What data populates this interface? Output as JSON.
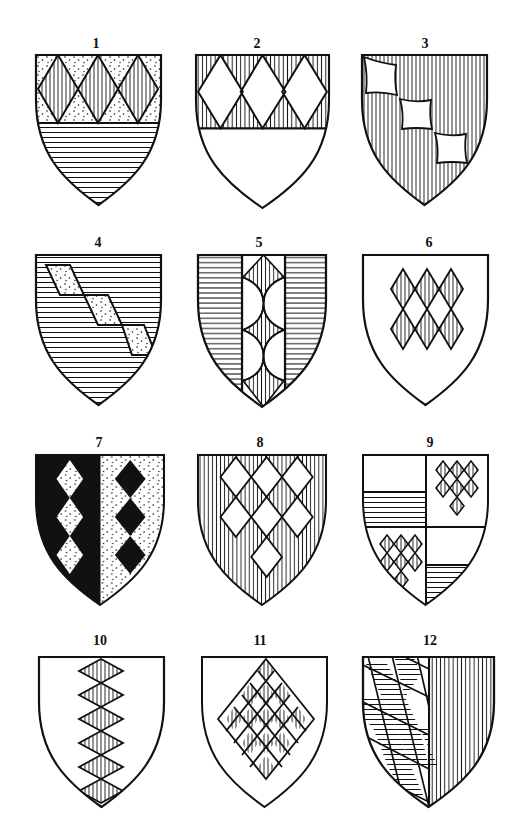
{
  "figure": {
    "ink_color": "#111111",
    "paper_color": "#ffffff",
    "shields": [
      {
        "number": "1",
        "x": 36,
        "y": 55,
        "w": 125,
        "h": 148,
        "description": "Chief dotted with three vertically hatched lozenges conjoined; base horizontally hatched"
      },
      {
        "number": "2",
        "x": 196,
        "y": 55,
        "w": 133,
        "h": 153,
        "description": "Chief vertically hatched with three plain lozenges conjoined; base plain"
      },
      {
        "number": "3",
        "x": 362,
        "y": 55,
        "w": 125,
        "h": 150,
        "description": "Vertically hatched field with three plain cushions in bend"
      },
      {
        "number": "4",
        "x": 36,
        "y": 255,
        "w": 125,
        "h": 150,
        "description": "Horizontally hatched field with three dotted fusils in bend"
      },
      {
        "number": "5",
        "x": 198,
        "y": 255,
        "w": 128,
        "h": 152,
        "description": "Horizontally hatched field, plain pale charged with vertically hatched mascles"
      },
      {
        "number": "6",
        "x": 363,
        "y": 255,
        "w": 126,
        "h": 150,
        "description": "Plain field with six vertically hatched lozenges, 3 and 3"
      },
      {
        "number": "7",
        "x": 36,
        "y": 455,
        "w": 128,
        "h": 150,
        "description": "Party per pale black and dotted, three lozenges counterchanged"
      },
      {
        "number": "8",
        "x": 198,
        "y": 455,
        "w": 128,
        "h": 150,
        "description": "Vertically hatched field with seven plain lozenges 3, 3, 1"
      },
      {
        "number": "9",
        "x": 363,
        "y": 455,
        "w": 126,
        "h": 150,
        "description": "Quarterly: 1 and 4 plain over horizontal hatching; 2 and 3 plain with seven hatched lozenges"
      },
      {
        "number": "10",
        "x": 39,
        "y": 657,
        "w": 124,
        "h": 150,
        "description": "Plain field with pale of six vertically hatched lozenges"
      },
      {
        "number": "11",
        "x": 202,
        "y": 657,
        "w": 125,
        "h": 150,
        "description": "Plain field with large lozenge checkered with vertically hatched lozenges"
      },
      {
        "number": "12",
        "x": 363,
        "y": 657,
        "w": 131,
        "h": 150,
        "description": "Party per pale: bendy-lozengy horizontally hatched and plain; vertically hatched"
      }
    ]
  }
}
